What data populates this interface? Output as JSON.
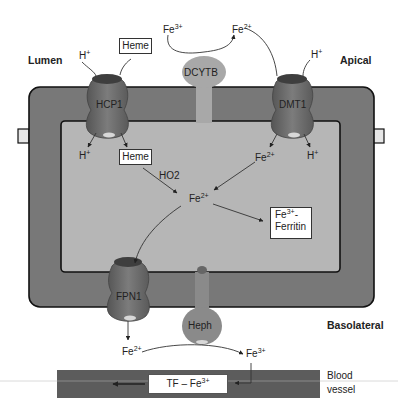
{
  "diagram": {
    "regions": {
      "lumen": "Lumen",
      "apical": "Apical",
      "basolateral": "Basolateral",
      "blood_vessel": [
        "Blood",
        "vessel"
      ]
    },
    "transporters": {
      "hcp1": "HCP1",
      "dmt1": "DMT1",
      "dcytb": "DCYTB",
      "fpn1": "FPN1",
      "heph": "Heph"
    },
    "species": {
      "h_plus": {
        "base": "H",
        "charge": "+"
      },
      "fe3": {
        "base": "Fe",
        "charge": "3+"
      },
      "fe2": {
        "base": "Fe",
        "charge": "2+"
      }
    },
    "boxes": {
      "heme_outside": "Heme",
      "heme_inside": "Heme",
      "ferritin": {
        "line1_base": "Fe",
        "line1_charge": "3+",
        "line1_suffix": "-",
        "line2": "Ferritin"
      },
      "tf_fe": {
        "prefix": "TF – Fe",
        "charge": "3+"
      }
    },
    "enzymes": {
      "ho2": "HO2"
    },
    "colors": {
      "cell_wall": "#787878",
      "cytoplasm": "#b6b6b6",
      "transporter": "#6e6e6e",
      "dcytb": "#a8a8a8",
      "vessel": "#5c5c5c",
      "outline": "#111111"
    }
  }
}
